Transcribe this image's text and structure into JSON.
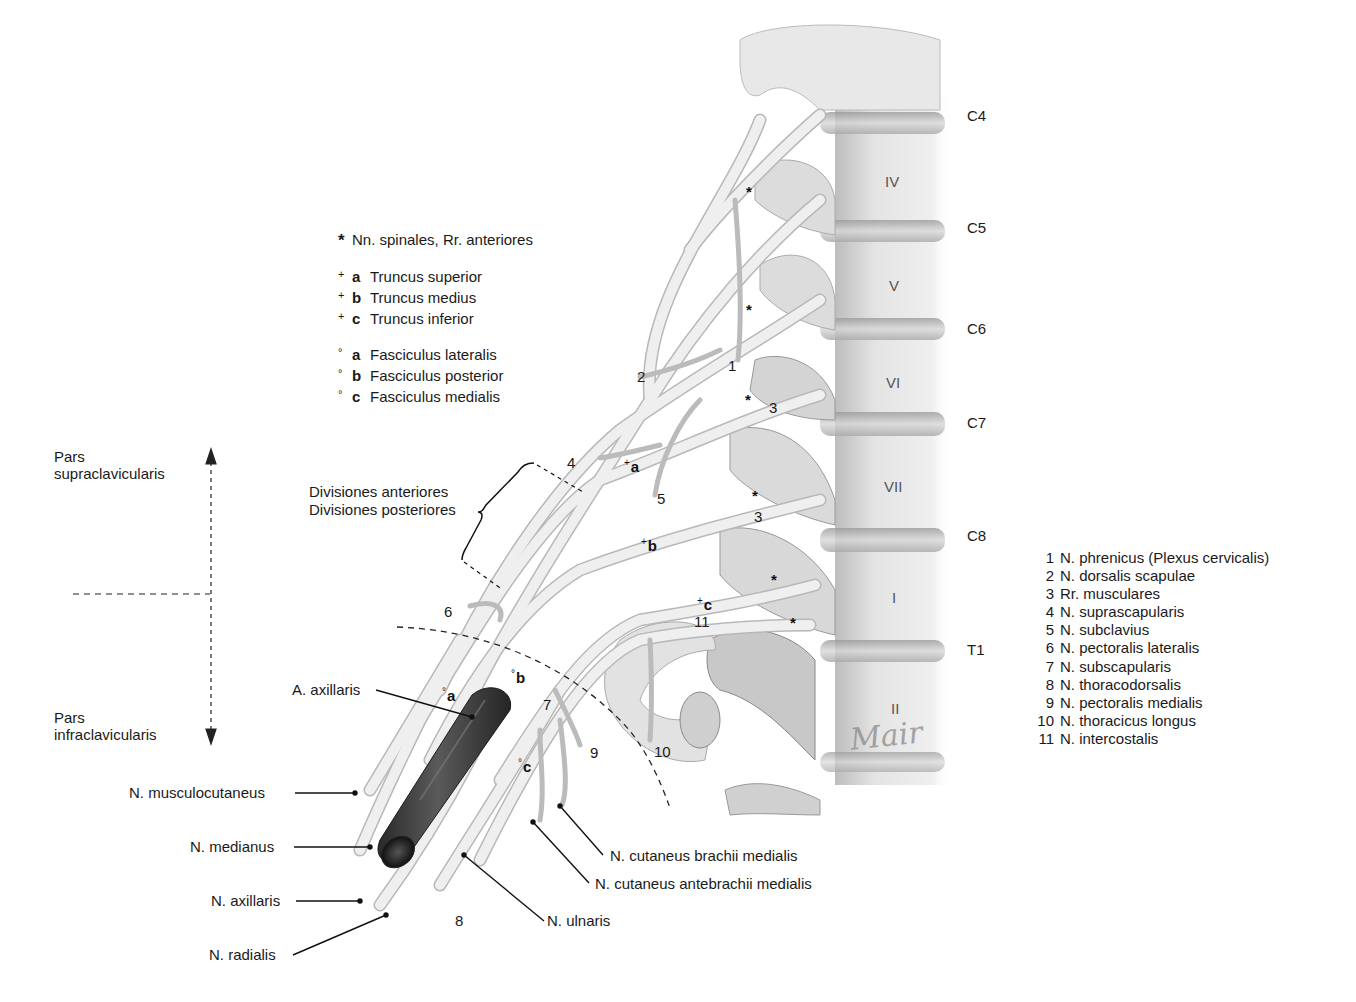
{
  "diagram": {
    "colors": {
      "nerve_fill": "#ececec",
      "nerve_stroke": "#b5b5b5",
      "bone_fill": "#e6e6e6",
      "bone_shadow": "#9c9c9c",
      "artery": "#3a3a3a",
      "artery_highlight": "#6a6a6a",
      "text": "#1a1a1a"
    }
  },
  "legend_symbols": {
    "star": {
      "symbol": "*",
      "text": "Nn. spinales, Rr. anteriores"
    },
    "trunks": [
      {
        "symbol": "+",
        "key": "a",
        "text": "Truncus superior"
      },
      {
        "symbol": "+",
        "key": "b",
        "text": "Truncus medius"
      },
      {
        "symbol": "+",
        "key": "c",
        "text": "Truncus inferior"
      }
    ],
    "cords": [
      {
        "symbol": "°",
        "key": "a",
        "text": "Fasciculus lateralis"
      },
      {
        "symbol": "°",
        "key": "b",
        "text": "Fasciculus posterior"
      },
      {
        "symbol": "°",
        "key": "c",
        "text": "Fasciculus medialis"
      }
    ]
  },
  "legend_numbers": [
    {
      "n": "1",
      "text": "N. phrenicus (Plexus cervicalis)"
    },
    {
      "n": "2",
      "text": "N. dorsalis scapulae"
    },
    {
      "n": "3",
      "text": "Rr. musculares"
    },
    {
      "n": "4",
      "text": "N. suprascapularis"
    },
    {
      "n": "5",
      "text": "N. subclavius"
    },
    {
      "n": "6",
      "text": "N. pectoralis lateralis"
    },
    {
      "n": "7",
      "text": "N. subscapularis"
    },
    {
      "n": "8",
      "text": "N. thoracodorsalis"
    },
    {
      "n": "9",
      "text": "N. pectoralis medialis"
    },
    {
      "n": "10",
      "text": "N. thoracicus longus"
    },
    {
      "n": "11",
      "text": "N. intercostalis"
    }
  ],
  "segments": [
    "C4",
    "C5",
    "C6",
    "C7",
    "C8",
    "T1"
  ],
  "vertebrae": [
    "IV",
    "V",
    "VI",
    "VII",
    "I",
    "II"
  ],
  "regions": {
    "supra": [
      "Pars",
      "supraclavicularis"
    ],
    "infra": [
      "Pars",
      "infraclavicularis"
    ]
  },
  "divisions": [
    "Divisiones anteriores",
    "Divisiones posteriores"
  ],
  "leader_labels": {
    "artery": "A. axillaris",
    "musculocutaneus": "N. musculocutaneus",
    "medianus": "N. medianus",
    "axillaris": "N. axillaris",
    "radialis": "N. radialis",
    "ulnaris": "N. ulnaris",
    "cut_antebrachii": "N. cutaneus antebrachii medialis",
    "cut_brachii": "N. cutaneus brachii medialis"
  },
  "markers": {
    "star": "*",
    "trunk_a": "a",
    "trunk_b": "b",
    "trunk_c": "c",
    "cord_a": "a",
    "cord_b": "b",
    "cord_c": "c",
    "plus": "+",
    "deg": "°"
  },
  "numbers": {
    "n1": "1",
    "n2": "2",
    "n3a": "3",
    "n3b": "3",
    "n4": "4",
    "n5": "5",
    "n6": "6",
    "n7": "7",
    "n8": "8",
    "n9": "9",
    "n10": "10",
    "n11": "11"
  },
  "signature": "Mair"
}
